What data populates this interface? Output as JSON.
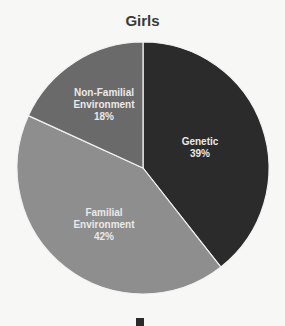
{
  "chart_data": {
    "type": "pie",
    "title": "Girls",
    "categories": [
      "Genetic",
      "Familial Environment",
      "Non-Familial Environment"
    ],
    "values": [
      39,
      42,
      18
    ],
    "unit": "%",
    "colors": [
      "#2b2b2b",
      "#8e8e8e",
      "#6a6a6a"
    ],
    "start_angle": "12 o'clock, clockwise",
    "data_labels": [
      "Genetic\n39%",
      "Familial\nEnvironment\n42%",
      "Non-Familial\nEnvironment\n18%"
    ],
    "legend": "none"
  },
  "labels": {
    "genetic_name": "Genetic",
    "genetic_value": "39%",
    "familial_name1": "Familial",
    "familial_name2": "Environment",
    "familial_value": "42%",
    "nonfamilial_name1": "Non-Familial",
    "nonfamilial_name2": "Environment",
    "nonfamilial_value": "18%"
  }
}
